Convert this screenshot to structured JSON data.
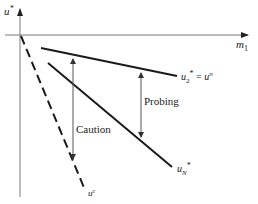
{
  "diagram": {
    "axes": {
      "y_label": "u*",
      "y_label_base": "u",
      "y_label_sup": "*",
      "x_label": "m1",
      "x_label_base": "m",
      "x_label_sub": "1"
    },
    "lines": {
      "cautious": {
        "label": "u^c",
        "label_base": "u",
        "label_sup": "c",
        "style": "dashed"
      },
      "certainty_equivalent": {
        "label": "u2* = u^n",
        "label_base": "u",
        "label_sub": "2",
        "label_star": "*",
        "label_eq": " = ",
        "label_rhs_base": "u",
        "label_rhs_sup": "n",
        "style": "solid"
      },
      "dual_optimal": {
        "label": "uN*",
        "label_base": "u",
        "label_sub": "N",
        "label_star": "*",
        "style": "solid"
      }
    },
    "annotations": {
      "caution": "Caution",
      "probing": "Probing"
    },
    "colors": {
      "axis": "#7a7a7a",
      "line": "#1a1a1a",
      "arrow": "#555555",
      "text": "#222222"
    }
  }
}
